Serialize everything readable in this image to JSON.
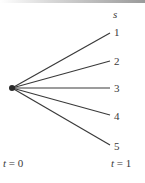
{
  "diagram": {
    "type": "scenario-tree",
    "root": {
      "x": 12,
      "y": 88
    },
    "state_axis_label": "s",
    "branches": [
      {
        "label": "1",
        "end": {
          "x": 110,
          "y": 33
        }
      },
      {
        "label": "2",
        "end": {
          "x": 110,
          "y": 61
        }
      },
      {
        "label": "3",
        "end": {
          "x": 110,
          "y": 88
        }
      },
      {
        "label": "4",
        "end": {
          "x": 110,
          "y": 115
        }
      },
      {
        "label": "5",
        "end": {
          "x": 110,
          "y": 145
        }
      }
    ],
    "time_labels": {
      "start_var": "t",
      "start_value": "= 0",
      "end_var": "t",
      "end_value": "= 1"
    },
    "line_color": "#3a3a3a"
  }
}
